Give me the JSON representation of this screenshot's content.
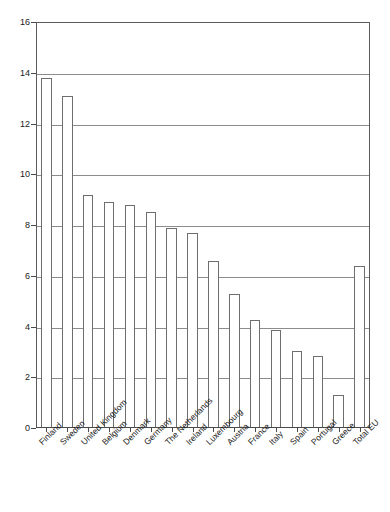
{
  "chart_data": {
    "type": "bar",
    "title": "",
    "subtitle": "",
    "xlabel": "",
    "ylabel": "",
    "ylim": [
      0,
      16
    ],
    "ytick_step": 2,
    "yticks": [
      "0",
      "2",
      "4",
      "6",
      "8",
      "10",
      "12",
      "14",
      "16"
    ],
    "grid": true,
    "legend": false,
    "bar_style": {
      "fill": "#ffffff",
      "edge": "#6e6e6e"
    },
    "categories": [
      "Finland",
      "Sweden",
      "United Kingdom",
      "Belgium",
      "Denmark",
      "Germany",
      "The Netherlands",
      "Ireland",
      "Luxembourg",
      "Austria",
      "France",
      "Italy",
      "Spain",
      "Portugal",
      "Greece",
      "Total EU"
    ],
    "values": [
      13.8,
      13.1,
      9.2,
      8.9,
      8.8,
      8.5,
      7.9,
      7.7,
      6.6,
      5.3,
      4.25,
      3.85,
      3.05,
      2.85,
      1.3,
      6.4
    ]
  }
}
